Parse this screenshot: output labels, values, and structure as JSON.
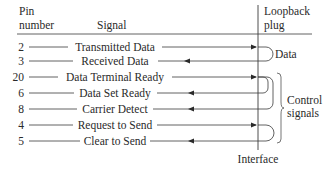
{
  "header": {
    "pin_col": [
      "Pin",
      "number"
    ],
    "signal_col": "Signal",
    "plug_col": [
      "Loopback",
      "plug"
    ]
  },
  "rows": [
    {
      "pin": "2",
      "signal": "Transmitted Data",
      "direction": "out"
    },
    {
      "pin": "3",
      "signal": "Received Data",
      "direction": "in"
    },
    {
      "pin": "20",
      "signal": "Data Terminal Ready",
      "direction": "out"
    },
    {
      "pin": "6",
      "signal": "Data Set Ready",
      "direction": "in"
    },
    {
      "pin": "8",
      "signal": "Carrier Detect",
      "direction": "in"
    },
    {
      "pin": "4",
      "signal": "Request to Send",
      "direction": "out"
    },
    {
      "pin": "5",
      "signal": "Clear to Send",
      "direction": "in"
    }
  ],
  "groups": {
    "data": "Data",
    "control": [
      "Control",
      "signals"
    ]
  },
  "footer": {
    "interface": "Interface"
  },
  "colors": {
    "line": "#3a3a3a",
    "text": "#2a2a2a"
  }
}
